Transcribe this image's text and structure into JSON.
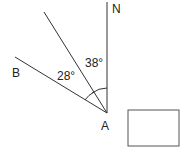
{
  "diagram": {
    "type": "bearing-angle-diagram",
    "labels": {
      "north": "N",
      "point_a": "A",
      "point_b": "B",
      "angle_upper": "38°",
      "angle_lower": "28°"
    },
    "points": {
      "A": [
        107,
        113
      ],
      "N_end": [
        107,
        2
      ],
      "mid_ray_end": [
        44,
        12
      ],
      "B_ray_end": [
        15,
        57
      ]
    },
    "answer_box": {
      "value": ""
    },
    "colors": {
      "stroke": "#333333",
      "background": "#ffffff"
    }
  }
}
